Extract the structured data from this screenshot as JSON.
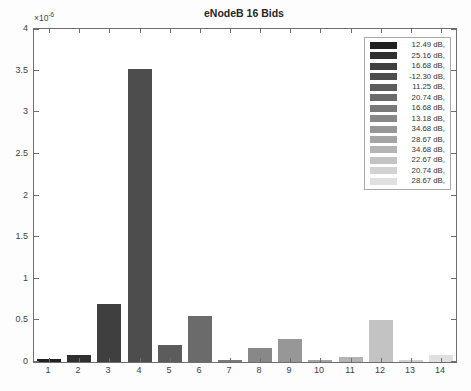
{
  "chart_data": {
    "type": "bar",
    "title": "eNodeB 16 Bids",
    "x_categories": [
      "1",
      "2",
      "3",
      "4",
      "5",
      "6",
      "7",
      "8",
      "9",
      "10",
      "11",
      "12",
      "13",
      "14"
    ],
    "values": [
      0.04,
      0.09,
      0.7,
      3.52,
      0.21,
      0.55,
      0.03,
      0.17,
      0.28,
      0.03,
      0.06,
      0.5,
      0.02,
      0.08
    ],
    "value_unit_scale": "1e-6",
    "ylim": [
      0,
      4
    ],
    "ytick_values": [
      0,
      0.5,
      1,
      1.5,
      2,
      2.5,
      3,
      3.5,
      4
    ],
    "ytick_labels": [
      "0",
      "0.5",
      "1",
      "1.5",
      "2",
      "2.5",
      "3",
      "3.5",
      "4"
    ],
    "y_exponent_base": "×10",
    "y_exponent_power": "-6",
    "grid": false,
    "legend_position": "top-right",
    "bar_colors": [
      "#212121",
      "#303030",
      "#3f3f3f",
      "#4d4d4d",
      "#5c5c5c",
      "#6b6b6b",
      "#797979",
      "#888888",
      "#979797",
      "#a5a5a5",
      "#b4b4b4",
      "#c3c3c3",
      "#d2d2d2",
      "#e0e0e0"
    ],
    "legend_entries": [
      "12.49 dB,",
      "25.16 dB,",
      "16.68 dB,",
      "-12.30 dB,",
      "11.25 dB,",
      "20.74 dB,",
      "16.68 dB,",
      "13.18 dB,",
      "34.68 dB,",
      "28.67 dB,",
      "34.68 dB,",
      "22.67 dB,",
      "20.74 dB,",
      "28.67 dB,"
    ],
    "colors": {
      "axis": "#6e6e6e",
      "text": "#3f3f3f",
      "plot_bg": "#ffffff",
      "figure_bg": "#fdfdfd",
      "legend_border": "#a9a9a9"
    }
  }
}
